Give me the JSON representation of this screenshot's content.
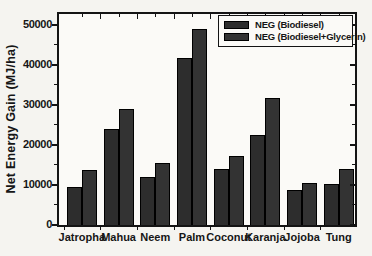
{
  "figure": {
    "background": "#f5f4f0",
    "plot_background": "#fbfaf7",
    "frame_color": "#141414",
    "text_color": "#161616"
  },
  "chart_data": {
    "type": "bar",
    "title": "",
    "xlabel": "",
    "ylabel": "Net Energy Gain (MJ/ha)",
    "categories": [
      "Jatropha",
      "Mahua",
      "Neem",
      "Palm",
      "Coconut",
      "Karanja",
      "Jojoba",
      "Tung"
    ],
    "series": [
      {
        "name": "NEG (Biodiesel)",
        "color": "#2d2d2d",
        "values": [
          9600,
          23900,
          12000,
          41700,
          13900,
          22600,
          8800,
          10300
        ]
      },
      {
        "name": "NEG (Biodiesel+Glycerin)",
        "color": "#333333",
        "values": [
          13700,
          29100,
          15400,
          49000,
          17200,
          31800,
          10500,
          14000
        ]
      }
    ],
    "ylim": [
      0,
      52700
    ],
    "yticks": [
      0,
      10000,
      20000,
      30000,
      40000,
      50000
    ],
    "minor_tick_interval": 5000,
    "legend_position": "top-right",
    "grid": false
  }
}
